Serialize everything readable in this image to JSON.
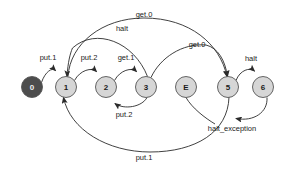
{
  "diagram": {
    "type": "state-machine",
    "title": "",
    "canvas": {
      "width": 291,
      "height": 169,
      "background": "#ffffff"
    },
    "colors": {
      "start_node_fill": "#4d4d4d",
      "node_fill": "#d6d6d6",
      "node_stroke": "#555555",
      "edge_stroke": "#2b2b2b",
      "label_text": "#1a1a1a",
      "start_node_text": "#f0f0f0"
    },
    "nodes": [
      {
        "id": "n0",
        "label": "0",
        "cx": 32,
        "cy": 87,
        "r": 10.5,
        "start": true
      },
      {
        "id": "n1",
        "label": "1",
        "cx": 66,
        "cy": 87,
        "r": 10.5,
        "start": false
      },
      {
        "id": "n2",
        "label": "2",
        "cx": 106,
        "cy": 87,
        "r": 10.5,
        "start": false
      },
      {
        "id": "n3",
        "label": "3",
        "cx": 146,
        "cy": 87,
        "r": 10.5,
        "start": false
      },
      {
        "id": "nE",
        "label": "E",
        "cx": 186,
        "cy": 87,
        "r": 10.5,
        "start": false
      },
      {
        "id": "n5",
        "label": "5",
        "cx": 228,
        "cy": 87,
        "r": 10.5,
        "start": false
      },
      {
        "id": "n6",
        "label": "6",
        "cx": 263,
        "cy": 87,
        "r": 10.5,
        "start": false
      }
    ],
    "edges": [
      {
        "id": "e-0-1",
        "from": "0",
        "to": "1",
        "label": "put.1",
        "label_x": 48,
        "label_y": 57
      },
      {
        "id": "e-1-2",
        "from": "1",
        "to": "2",
        "label": "put.2",
        "label_x": 89,
        "label_y": 57
      },
      {
        "id": "e-2-3",
        "from": "2",
        "to": "3",
        "label": "get.1",
        "label_x": 126,
        "label_y": 57
      },
      {
        "id": "e-3-2",
        "from": "3",
        "to": "2",
        "label": "put.2",
        "label_x": 124,
        "label_y": 114
      },
      {
        "id": "e-1-5",
        "from": "1",
        "to": "5",
        "label": "get.0",
        "label_x": 144,
        "label_y": 14
      },
      {
        "id": "e-3-1",
        "from": "3",
        "to": "1",
        "label": "halt",
        "label_x": 122,
        "label_y": 28
      },
      {
        "id": "e-3-5",
        "from": "3",
        "to": "5",
        "label": "get.0",
        "label_x": 197,
        "label_y": 44
      },
      {
        "id": "e-5-6",
        "from": "5",
        "to": "6",
        "label": "halt",
        "label_x": 251,
        "label_y": 58
      },
      {
        "id": "e-6-5",
        "from": "6",
        "to": "5",
        "label": "halt_exception",
        "label_x": 232,
        "label_y": 128
      },
      {
        "id": "e-5-1",
        "from": "5",
        "to": "1",
        "label": "put.1",
        "label_x": 144,
        "label_y": 157
      }
    ],
    "edge_labels": [
      "put.1",
      "put.2",
      "get.1",
      "put.2",
      "get.0",
      "halt",
      "get.0",
      "halt",
      "halt_exception",
      "put.1"
    ]
  }
}
